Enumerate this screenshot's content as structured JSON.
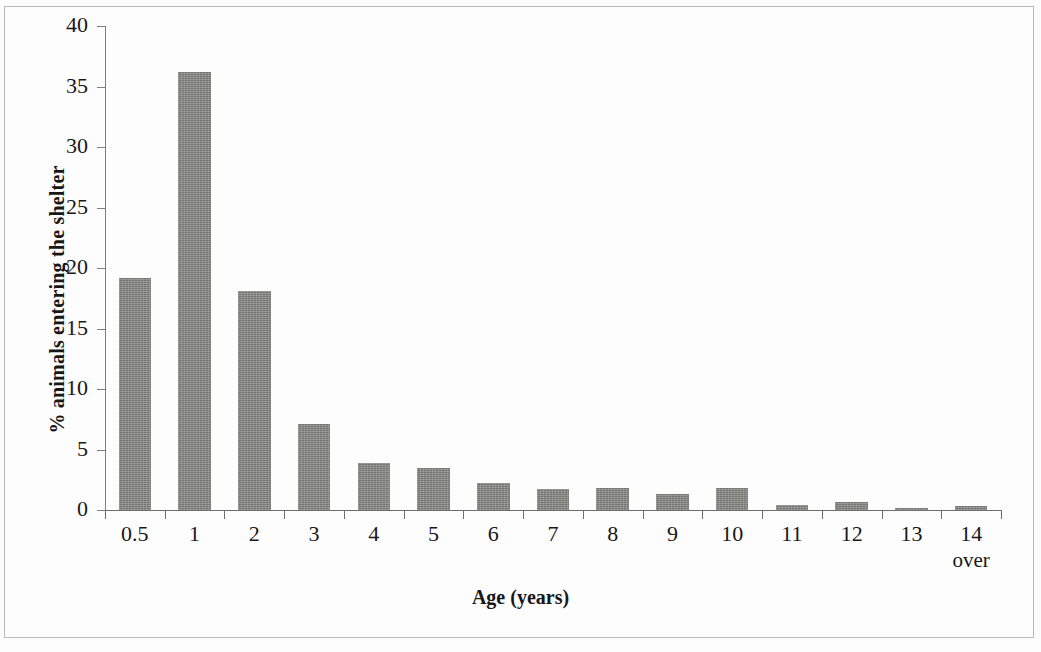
{
  "chart_data": {
    "type": "bar",
    "title": "",
    "xlabel": "Age (years)",
    "ylabel": "% animals entering the shelter",
    "categories": [
      "0.5",
      "1",
      "2",
      "3",
      "4",
      "5",
      "6",
      "7",
      "8",
      "9",
      "10",
      "11",
      "12",
      "13",
      "14"
    ],
    "category_sublabels": [
      "",
      "",
      "",
      "",
      "",
      "",
      "",
      "",
      "",
      "",
      "",
      "",
      "",
      "",
      "over"
    ],
    "values": [
      19.2,
      36.2,
      18.1,
      7.1,
      3.9,
      3.5,
      2.2,
      1.7,
      1.85,
      1.3,
      1.8,
      0.4,
      0.7,
      0.2,
      0.3
    ],
    "ylim": [
      0,
      40
    ],
    "ytick_values": [
      0,
      5,
      10,
      15,
      20,
      25,
      30,
      35,
      40
    ],
    "ytick_labels": [
      "0",
      "5",
      "10",
      "15",
      "20",
      "25",
      "30",
      "35",
      "40"
    ],
    "grid": false,
    "legend": false,
    "legend_position": "none",
    "bar_color": "#83837f",
    "axis_color": "#6e6e70",
    "text_color": "#181818",
    "background_color": "#fdfdfd",
    "frame_color": "#b9b9bb"
  }
}
